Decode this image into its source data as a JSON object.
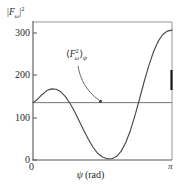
{
  "chart_data": {
    "type": "line",
    "title": "",
    "subtitle": "",
    "xlabel": "ψ (rad)",
    "ylabel": "|Fω|²",
    "xlim": [
      0,
      3.14159
    ],
    "ylim": [
      0,
      320
    ],
    "grid": false,
    "legend_position": "none",
    "xticks": [
      0,
      3.14159
    ],
    "xticklabels": [
      "0",
      "π"
    ],
    "yticks": [
      0,
      100,
      200,
      300
    ],
    "yticklabels": [
      "0",
      "100",
      "200",
      "300"
    ],
    "series": [
      {
        "name": "|Fω|²",
        "type": "line",
        "x": [
          0.0,
          0.105,
          0.209,
          0.314,
          0.419,
          0.524,
          0.628,
          0.733,
          0.838,
          0.942,
          1.047,
          1.152,
          1.257,
          1.361,
          1.466,
          1.571,
          1.676,
          1.78,
          1.885,
          1.99,
          2.094,
          2.199,
          2.304,
          2.409,
          2.513,
          2.618,
          2.723,
          2.827,
          2.932,
          3.037,
          3.142
        ],
        "y": [
          133,
          141,
          152,
          161,
          165,
          164,
          158,
          147,
          131,
          112,
          90,
          68,
          47,
          29,
          15,
          7,
          3,
          3,
          8,
          20,
          40,
          68,
          103,
          142,
          182,
          219,
          251,
          275,
          291,
          299,
          301
        ]
      },
      {
        "name": "⟨F²ω⟩ψ",
        "type": "hline",
        "value": 133
      }
    ],
    "annotations": [
      {
        "text": "⟨F²ω⟩ψ",
        "points_to": "average-line",
        "x": 1.05,
        "y": 225
      }
    ]
  },
  "axes": {
    "ylabel_parts": {
      "bar_left": "|",
      "f": "F",
      "omega": "ω",
      "bar_right": "|",
      "exp": "2"
    },
    "xlabel_parts": {
      "psi": "ψ",
      "unit": "(rad)"
    },
    "yticklabels": [
      "300",
      "200",
      "100",
      "0"
    ],
    "xticklabels": [
      "0",
      "π"
    ]
  },
  "annotation": {
    "bracket_open": "⟨",
    "f": "F",
    "sup": "2",
    "sub": "ω",
    "bracket_close": "⟩",
    "outer_sub": "ψ"
  },
  "colors": {
    "curve": "#4a4a4a",
    "average_line": "#6d6d6d",
    "axis": "#575757",
    "frame": "#8a8a8a",
    "text": "#1f1f1f",
    "background": "#ffffff",
    "right_marker": "#1a1a1a"
  }
}
